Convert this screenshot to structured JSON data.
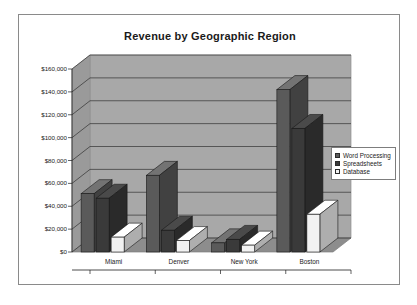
{
  "chart_data": {
    "type": "bar",
    "title": "Revenue by Geographic Region",
    "xlabel": "",
    "ylabel": "",
    "categories": [
      "Miami",
      "Denver",
      "New York",
      "Boston"
    ],
    "series": [
      {
        "name": "Word Processing",
        "values": [
          51000,
          67000,
          8000,
          142000
        ],
        "color": "#5a5a5a"
      },
      {
        "name": "Spreadsheets",
        "values": [
          47000,
          19000,
          11000,
          108000
        ],
        "color": "#3a3a3a"
      },
      {
        "name": "Database",
        "values": [
          13000,
          10000,
          6000,
          33000
        ],
        "color": "#f2f2f2"
      }
    ],
    "ylim": [
      0,
      160000
    ],
    "ytick_values": [
      0,
      20000,
      40000,
      60000,
      80000,
      100000,
      120000,
      140000,
      160000
    ],
    "ytick_labels": [
      "$0",
      "$20,000",
      "$40,000",
      "$60,000",
      "$80,000",
      "$100,000",
      "$120,000",
      "$140,000",
      "$160,000"
    ],
    "grid": true,
    "legend_position": "right",
    "style": "3d-column",
    "plot_background": "#a8a8a8",
    "floor_color": "#8d8d8d",
    "wall_side_color": "#9a9a9a"
  },
  "legend": {
    "entries": [
      {
        "label": "Word Processing",
        "color": "#5a5a5a"
      },
      {
        "label": "Spreadsheets",
        "color": "#3a3a3a"
      },
      {
        "label": "Database",
        "color": "#f2f2f2"
      }
    ]
  }
}
